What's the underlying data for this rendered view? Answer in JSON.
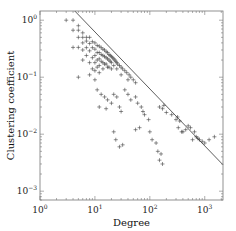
{
  "chart_data": {
    "type": "scatter",
    "title": "",
    "xlabel": "Degree",
    "ylabel": "Clustering coefficient",
    "xscale": "log",
    "yscale": "log",
    "xlim": [
      1,
      2150
    ],
    "ylim": [
      0.0007,
      1.45
    ],
    "x_ticks": [
      {
        "value": 1,
        "base": "10",
        "exp": "0"
      },
      {
        "value": 10,
        "base": "10",
        "exp": "1"
      },
      {
        "value": 100,
        "base": "10",
        "exp": "2"
      },
      {
        "value": 1000,
        "base": "10",
        "exp": "3"
      }
    ],
    "y_ticks": [
      {
        "value": 1,
        "base": "10",
        "exp": "0"
      },
      {
        "value": 0.1,
        "base": "10",
        "exp": "−1"
      },
      {
        "value": 0.01,
        "base": "10",
        "exp": "−2"
      },
      {
        "value": 0.001,
        "base": "10",
        "exp": "−3"
      }
    ],
    "grid": false,
    "legend": null,
    "marker": "+",
    "series": [
      {
        "name": "nodes",
        "marker": "+",
        "description": "dense cloud of nodes concentrated at degree ~10-40 with clustering ~0.1-0.6; sparse outliers down to ~0.004 at degree ~100-200 and tail up to degree ~1500 with clustering ~0.01-0.03",
        "points": [
          [
            3,
            1.0
          ],
          [
            4,
            1.0
          ],
          [
            4,
            0.667
          ],
          [
            5,
            0.667
          ],
          [
            5,
            0.5
          ],
          [
            5,
            0.8
          ],
          [
            6,
            0.5
          ],
          [
            6,
            0.6
          ],
          [
            6,
            0.4
          ],
          [
            5,
            0.333
          ],
          [
            4,
            0.333
          ],
          [
            6,
            0.3
          ],
          [
            5,
            0.1
          ],
          [
            6,
            0.2
          ],
          [
            7,
            0.5
          ],
          [
            7,
            0.43
          ],
          [
            7,
            0.33
          ],
          [
            7,
            0.24
          ],
          [
            8,
            0.5
          ],
          [
            8,
            0.39
          ],
          [
            8,
            0.29
          ],
          [
            8,
            0.18
          ],
          [
            8,
            0.11
          ],
          [
            9,
            0.42
          ],
          [
            9,
            0.33
          ],
          [
            9,
            0.22
          ],
          [
            9,
            0.14
          ],
          [
            10,
            0.4
          ],
          [
            10,
            0.31
          ],
          [
            10,
            0.24
          ],
          [
            10,
            0.18
          ],
          [
            10,
            0.13
          ],
          [
            10,
            0.09
          ],
          [
            11,
            0.36
          ],
          [
            11,
            0.27
          ],
          [
            11,
            0.2
          ],
          [
            11,
            0.15
          ],
          [
            12,
            0.35
          ],
          [
            12,
            0.27
          ],
          [
            12,
            0.21
          ],
          [
            12,
            0.16
          ],
          [
            12,
            0.12
          ],
          [
            13,
            0.33
          ],
          [
            13,
            0.25
          ],
          [
            13,
            0.19
          ],
          [
            14,
            0.31
          ],
          [
            14,
            0.24
          ],
          [
            14,
            0.18
          ],
          [
            14,
            0.14
          ],
          [
            15,
            0.3
          ],
          [
            15,
            0.23
          ],
          [
            15,
            0.17
          ],
          [
            16,
            0.28
          ],
          [
            16,
            0.22
          ],
          [
            16,
            0.17
          ],
          [
            17,
            0.27
          ],
          [
            17,
            0.21
          ],
          [
            17,
            0.15
          ],
          [
            18,
            0.25
          ],
          [
            18,
            0.2
          ],
          [
            18,
            0.15
          ],
          [
            19,
            0.24
          ],
          [
            19,
            0.19
          ],
          [
            20,
            0.23
          ],
          [
            20,
            0.18
          ],
          [
            20,
            0.14
          ],
          [
            21,
            0.22
          ],
          [
            22,
            0.21
          ],
          [
            22,
            0.16
          ],
          [
            23,
            0.2
          ],
          [
            24,
            0.19
          ],
          [
            25,
            0.18
          ],
          [
            25,
            0.14
          ],
          [
            26,
            0.17
          ],
          [
            28,
            0.16
          ],
          [
            30,
            0.15
          ],
          [
            30,
            0.11
          ],
          [
            32,
            0.14
          ],
          [
            35,
            0.13
          ],
          [
            38,
            0.12
          ],
          [
            40,
            0.09
          ],
          [
            42,
            0.11
          ],
          [
            45,
            0.1
          ],
          [
            50,
            0.09
          ],
          [
            55,
            0.08
          ],
          [
            11,
            0.06
          ],
          [
            13,
            0.05
          ],
          [
            15,
            0.045
          ],
          [
            17,
            0.04
          ],
          [
            20,
            0.035
          ],
          [
            12,
            0.03
          ],
          [
            16,
            0.028
          ],
          [
            22,
            0.05
          ],
          [
            25,
            0.045
          ],
          [
            28,
            0.03
          ],
          [
            35,
            0.06
          ],
          [
            40,
            0.05
          ],
          [
            45,
            0.04
          ],
          [
            55,
            0.045
          ],
          [
            60,
            0.035
          ],
          [
            70,
            0.03
          ],
          [
            30,
            0.025
          ],
          [
            22,
            0.011
          ],
          [
            24,
            0.008
          ],
          [
            28,
            0.006
          ],
          [
            32,
            0.0065
          ],
          [
            55,
            0.012
          ],
          [
            65,
            0.013
          ],
          [
            75,
            0.025
          ],
          [
            80,
            0.022
          ],
          [
            95,
            0.018
          ],
          [
            100,
            0.011
          ],
          [
            110,
            0.008
          ],
          [
            130,
            0.007
          ],
          [
            140,
            0.005
          ],
          [
            150,
            0.0035
          ],
          [
            160,
            0.0045
          ],
          [
            170,
            0.003
          ],
          [
            150,
            0.03
          ],
          [
            170,
            0.028
          ],
          [
            180,
            0.032
          ],
          [
            200,
            0.024
          ],
          [
            250,
            0.022
          ],
          [
            300,
            0.018
          ],
          [
            320,
            0.02
          ],
          [
            350,
            0.017
          ],
          [
            330,
            0.013
          ],
          [
            380,
            0.011
          ],
          [
            400,
            0.011
          ],
          [
            450,
            0.012
          ],
          [
            500,
            0.014
          ],
          [
            600,
            0.008
          ],
          [
            700,
            0.009
          ],
          [
            750,
            0.0085
          ],
          [
            800,
            0.008
          ],
          [
            900,
            0.0075
          ],
          [
            1000,
            0.007
          ],
          [
            1200,
            0.008
          ],
          [
            1500,
            0.009
          ],
          [
            550,
            0.013
          ],
          [
            650,
            0.011
          ]
        ]
      }
    ],
    "annotations": [
      {
        "type": "line",
        "description": "power-law fit C ~ k^-1",
        "x": [
          4.3,
          2150
        ],
        "y": [
          1.45,
          0.0029
        ]
      }
    ]
  }
}
